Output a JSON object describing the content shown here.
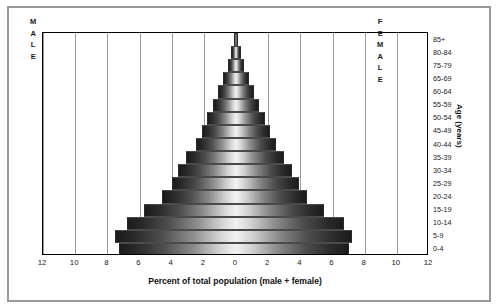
{
  "chart_data": {
    "type": "bar",
    "subtype": "population-pyramid",
    "title": "",
    "xlabel": "Percent of total population (male + female)",
    "ylabel": "Age (years)",
    "xlim": [
      -12,
      12
    ],
    "x_ticks": [
      "12",
      "10",
      "8",
      "6",
      "4",
      "2",
      "0",
      "2",
      "4",
      "6",
      "8",
      "10",
      "12"
    ],
    "x_tick_values": [
      -12,
      -10,
      -8,
      -6,
      -4,
      -2,
      0,
      2,
      4,
      6,
      8,
      10,
      12
    ],
    "grid": true,
    "grid_axis": "x",
    "legend": [
      "MALE",
      "FEMALE"
    ],
    "legend_position": "inside-plot-corners",
    "categories": [
      "85+",
      "80-84",
      "75-79",
      "65-69",
      "60-64",
      "55-59",
      "50-54",
      "45-49",
      "40-44",
      "35-39",
      "30-34",
      "25-29",
      "20-24",
      "15-19",
      "10-14",
      "5-9",
      "0-4"
    ],
    "series": [
      {
        "name": "MALE",
        "side": "left",
        "values": [
          0.15,
          0.3,
          0.5,
          0.8,
          1.1,
          1.4,
          1.8,
          2.1,
          2.5,
          3.1,
          3.6,
          4.0,
          4.6,
          5.7,
          6.8,
          7.5,
          7.3
        ]
      },
      {
        "name": "FEMALE",
        "side": "right",
        "values": [
          0.15,
          0.3,
          0.5,
          0.8,
          1.1,
          1.4,
          1.8,
          2.1,
          2.5,
          3.0,
          3.5,
          3.9,
          4.4,
          5.5,
          6.7,
          7.2,
          7.0
        ]
      }
    ]
  },
  "labels": {
    "male_letters": [
      "M",
      "A",
      "L",
      "E"
    ],
    "female_letters": [
      "F",
      "E",
      "M",
      "A",
      "L",
      "E"
    ]
  },
  "colors": {
    "frame": "#9a9a9a",
    "plot_border": "#000000",
    "gridline": "#9b9b9b",
    "bar_dark": "#1b1b1b",
    "bar_light": "#f2f2f2",
    "text": "#1a1a1a"
  }
}
